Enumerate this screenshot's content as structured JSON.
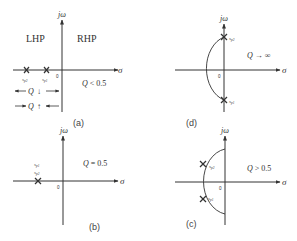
{
  "panels": {
    "a": {
      "label": "(a)",
      "axis_x": "σ",
      "axis_y": "jω",
      "origin": "0",
      "lhp": "LHP",
      "rhp": "RHP",
      "condition": "Q < 0.5",
      "poles": [
        "s_p2",
        "s_p1"
      ],
      "pole_labels": {
        "p2_main": "s",
        "p2_sub": "p2",
        "p1_main": "s",
        "p1_sub": "p1"
      },
      "arrow1": "Q ↓",
      "arrow2": "Q ↑"
    },
    "b": {
      "label": "(b)",
      "axis_x": "σ",
      "axis_y": "jω",
      "origin": "0",
      "condition": "Q = 0.5",
      "pole_labels": {
        "p1_main": "s",
        "p1_sub": "p1",
        "p2_main": "s",
        "p2_sub": "p2"
      }
    },
    "c": {
      "label": "(c)",
      "axis_x": "σ",
      "axis_y": "jω",
      "origin": "0",
      "condition": "Q > 0.5",
      "pole_labels": {
        "p2_main": "s",
        "p2_sub": "p2",
        "p1_main": "s",
        "p1_sub": "p1"
      }
    },
    "d": {
      "label": "(d)",
      "axis_x": "σ",
      "axis_y": "jω",
      "origin": "0",
      "condition": "Q → ∞",
      "pole_labels": {
        "p2_main": "s",
        "p2_sub": "p2",
        "p1_main": "s",
        "p1_sub": "p1"
      }
    }
  }
}
